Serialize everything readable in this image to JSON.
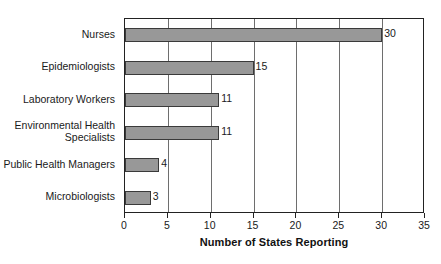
{
  "chart_data": {
    "type": "bar",
    "orientation": "horizontal",
    "title": "",
    "xlabel": "Number of States Reporting",
    "ylabel": "",
    "xlim": [
      0,
      35
    ],
    "xticks": [
      0,
      5,
      10,
      15,
      20,
      25,
      30,
      35
    ],
    "xtick_labels": [
      "0",
      "5",
      "10",
      "15",
      "20",
      "25",
      "30",
      "35"
    ],
    "grid": true,
    "grid_axis": "x",
    "legend": false,
    "categories": [
      "Nurses",
      "Epidemiologists",
      "Laboratory Workers",
      "Environmental Health\nSpecialists",
      "Public Health Managers",
      "Microbiologists"
    ],
    "values": [
      30,
      15,
      11,
      11,
      4,
      3
    ],
    "value_labels": [
      "30",
      "15",
      "11",
      "11",
      "4",
      "3"
    ],
    "bar_color": "#989898",
    "bar_edge_color": "#3a3a3a",
    "axis_color": "#222222",
    "grid_color": "#6e6e6e",
    "text_color": "#1a1a1a"
  }
}
